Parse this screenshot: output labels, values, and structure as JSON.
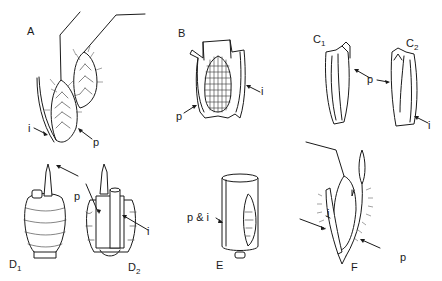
{
  "figure": {
    "panels": [
      {
        "id": "A",
        "label": "A",
        "callouts": [
          "i",
          "p"
        ]
      },
      {
        "id": "B",
        "label": "B",
        "callouts": [
          "p",
          "i"
        ]
      },
      {
        "id": "C1",
        "label": "C",
        "sub": "1",
        "callouts": [
          "p"
        ]
      },
      {
        "id": "C2",
        "label": "C",
        "sub": "2",
        "callouts": [
          "i"
        ]
      },
      {
        "id": "D1",
        "label": "D",
        "sub": "1",
        "callouts": [
          "p"
        ]
      },
      {
        "id": "D2",
        "label": "D",
        "sub": "2",
        "callouts": [
          "i"
        ]
      },
      {
        "id": "E",
        "label": "E",
        "callouts": [
          "p & i"
        ]
      },
      {
        "id": "F",
        "label": "F",
        "callouts": [
          "i",
          "p"
        ]
      }
    ],
    "callout_letters": {
      "p": "p",
      "i": "i",
      "p_and_i": "p & i"
    }
  }
}
